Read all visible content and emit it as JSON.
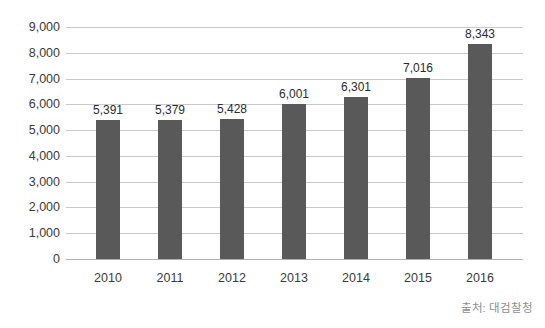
{
  "chart_data": {
    "type": "bar",
    "title": "",
    "subtitle": "",
    "xlabel": "",
    "ylabel": "",
    "categories": [
      "2010",
      "2011",
      "2012",
      "2013",
      "2014",
      "2015",
      "2016"
    ],
    "values": [
      5391,
      5379,
      5428,
      6001,
      6301,
      7016,
      8343
    ],
    "value_labels": [
      "5,391",
      "5,379",
      "5,428",
      "6,001",
      "6,301",
      "7,016",
      "8,343"
    ],
    "series": [
      {
        "name": "",
        "values": [
          5391,
          5379,
          5428,
          6001,
          6301,
          7016,
          8343
        ]
      }
    ],
    "ylim": [
      0,
      9000
    ],
    "ytick_values": [
      9000,
      8000,
      7000,
      6000,
      5000,
      4000,
      3000,
      2000,
      1000,
      0
    ],
    "ytick_labels": [
      "9,000",
      "8,000",
      "7,000",
      "6,000",
      "5,000",
      "4,000",
      "3,000",
      "2,000",
      "1,000",
      "0"
    ],
    "grid": true,
    "grid_axis": "y",
    "legend": false,
    "legend_position": "none",
    "bar_color": "#595959",
    "gridline_color": "#c9c9c9",
    "axis_color": "#b0b0b0",
    "label_color": "#3a3a3a",
    "annotations": {
      "source": "출처: 대검찰청"
    }
  }
}
